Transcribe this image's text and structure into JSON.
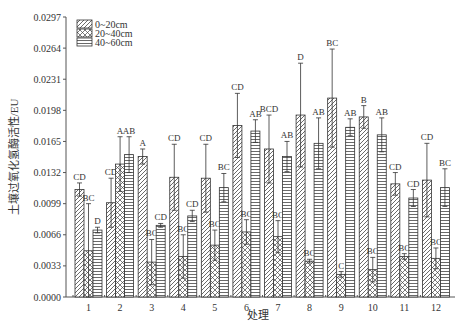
{
  "chart_data": {
    "type": "bar",
    "title": "",
    "xlabel": "处理",
    "ylabel": "土壤过氧化氢酶活性/EU",
    "ylim": [
      0,
      0.0297
    ],
    "yticks": [
      "0.0000",
      "0.0033",
      "0.0066",
      "0.0099",
      "0.0132",
      "0.0165",
      "0.0198",
      "0.0231",
      "0.0264",
      "0.0297"
    ],
    "categories": [
      "1",
      "2",
      "3",
      "4",
      "5",
      "6",
      "7",
      "8",
      "9",
      "10",
      "11",
      "12"
    ],
    "grid": false,
    "legend_position": "top-left",
    "series": [
      {
        "name": "0~20cm",
        "pattern": "diagonal",
        "values": [
          0.0114,
          0.01,
          0.0149,
          0.0127,
          0.0126,
          0.0182,
          0.0157,
          0.0193,
          0.0211,
          0.0191,
          0.012,
          0.0124
        ],
        "err_top": [
          0.0121,
          0.0126,
          0.0157,
          0.0162,
          0.0162,
          0.0216,
          0.0193,
          0.0248,
          0.0263,
          0.0203,
          0.0132,
          0.0163
        ],
        "letters": [
          "CD",
          "CD",
          "A",
          "CD",
          "CD",
          "CD",
          "BCD",
          "D",
          "BC",
          "B",
          "CD",
          "CD"
        ]
      },
      {
        "name": "20~40cm",
        "pattern": "crosshatch",
        "values": [
          0.0049,
          0.0141,
          0.0037,
          0.0043,
          0.0055,
          0.0069,
          0.0064,
          0.0038,
          0.0024,
          0.0029,
          0.0043,
          0.0041
        ],
        "err_top": [
          0.0099,
          0.017,
          0.0061,
          0.0066,
          0.0071,
          0.0082,
          0.0081,
          0.004,
          0.0027,
          0.0042,
          0.0046,
          0.0052
        ],
        "letters": [
          "BC",
          "A",
          "BC",
          "BC",
          "BC",
          "BC",
          "BC",
          "BC",
          "C",
          "BC",
          "BC",
          "BC"
        ]
      },
      {
        "name": "40~60cm",
        "pattern": "horizontal",
        "values": [
          0.0071,
          0.0151,
          0.0076,
          0.0086,
          0.0116,
          0.0176,
          0.0149,
          0.0163,
          0.018,
          0.0172,
          0.0105,
          0.0116
        ],
        "err_top": [
          0.0074,
          0.017,
          0.0078,
          0.0092,
          0.0131,
          0.0188,
          0.0165,
          0.019,
          0.0189,
          0.019,
          0.0114,
          0.0136
        ],
        "letters": [
          "D",
          "AB",
          "CD",
          "CD",
          "BC",
          "AB",
          "AB",
          "AB",
          "AB",
          "AB",
          "CD",
          "BC"
        ]
      }
    ]
  }
}
